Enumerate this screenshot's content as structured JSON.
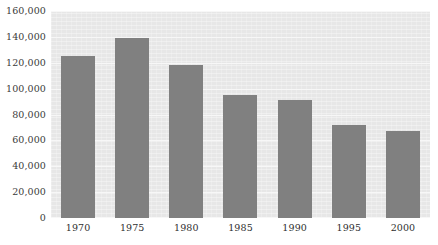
{
  "chart_data": {
    "type": "bar",
    "title": "",
    "subtitle": "",
    "xlabel": "",
    "ylabel": "",
    "categories": [
      "1970",
      "1975",
      "1980",
      "1985",
      "1990",
      "1995",
      "2000"
    ],
    "values": [
      125000,
      139000,
      118000,
      95000,
      91000,
      72000,
      67000
    ],
    "ylim": [
      0,
      160000
    ],
    "y_ticks": [
      0,
      20000,
      40000,
      60000,
      80000,
      100000,
      120000,
      140000,
      160000
    ],
    "y_tick_labels": [
      "0",
      "20,000",
      "40,000",
      "60,000",
      "80,000",
      "100,000",
      "120,000",
      "140,000",
      "160,000"
    ],
    "grid": true,
    "grid_axis": "y",
    "legend": false,
    "legend_position": "none",
    "series": [
      {
        "name": "",
        "values": [
          125000,
          139000,
          118000,
          95000,
          91000,
          72000,
          67000
        ]
      }
    ],
    "annotations": []
  },
  "style": {
    "bar_color": "#808080",
    "plot_background": "#e7e7e7",
    "page_background": "#ffffff",
    "gridline_color": "#f7f7f7",
    "tick_label_color": "#3a3a3a"
  }
}
